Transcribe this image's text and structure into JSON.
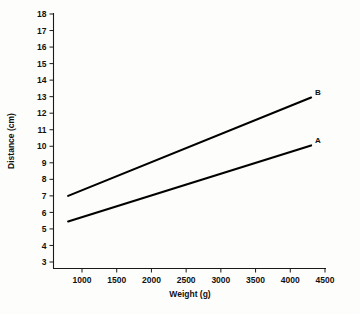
{
  "chart_data": {
    "type": "line",
    "title": "",
    "xlabel": "Weight (g)",
    "ylabel": "Distance (cm)",
    "xlim": [
      700,
      4600
    ],
    "ylim": [
      2.5,
      18
    ],
    "grid": false,
    "legend": "inline-end-labels",
    "xticks": [
      1000,
      1500,
      2000,
      2500,
      3000,
      3500,
      4000,
      4500
    ],
    "xtick_labels": [
      "1000",
      "1500",
      "2000",
      "2500",
      "3000",
      "3500",
      "4000",
      "4500"
    ],
    "yticks": [
      3,
      4,
      5,
      6,
      7,
      8,
      9,
      10,
      11,
      12,
      13,
      14,
      15,
      16,
      17,
      18
    ],
    "ytick_labels": [
      "3",
      "4",
      "5",
      "6",
      "7",
      "8",
      "9",
      "10",
      "11",
      "12",
      "13",
      "14",
      "15",
      "16",
      "17",
      "18"
    ],
    "series": [
      {
        "name": "B",
        "label": "B",
        "color": "#000000",
        "x": [
          800,
          4300
        ],
        "values": [
          7.0,
          12.95
        ]
      },
      {
        "name": "A",
        "label": "A",
        "color": "#000000",
        "x": [
          800,
          4300
        ],
        "values": [
          5.45,
          10.05
        ]
      }
    ]
  }
}
